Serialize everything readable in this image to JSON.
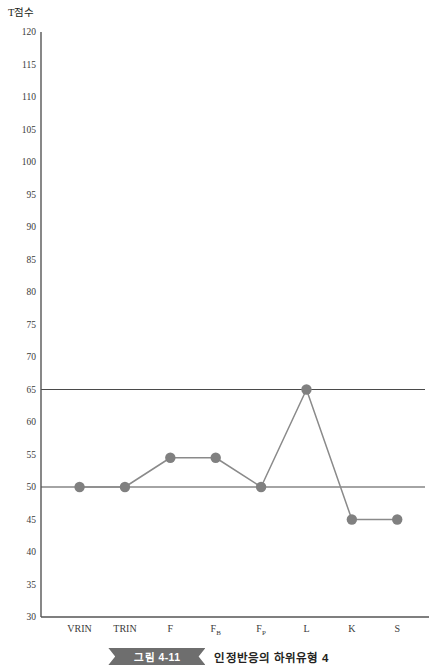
{
  "chart_data": {
    "type": "line",
    "title": "",
    "xlabel": "",
    "ylabel": "T점수",
    "ylim": [
      30,
      120
    ],
    "ytick_step": 5,
    "yticks": [
      30,
      35,
      40,
      45,
      50,
      55,
      60,
      65,
      70,
      75,
      80,
      85,
      90,
      95,
      100,
      105,
      110,
      115,
      120
    ],
    "grid": false,
    "legend": "none",
    "categories": [
      "VRIN",
      "TRIN",
      "F",
      "FB",
      "FP",
      "L",
      "K",
      "S"
    ],
    "category_labels": [
      {
        "base": "VRIN",
        "sub": ""
      },
      {
        "base": "TRIN",
        "sub": ""
      },
      {
        "base": "F",
        "sub": ""
      },
      {
        "base": "F",
        "sub": "B"
      },
      {
        "base": "F",
        "sub": "P"
      },
      {
        "base": "L",
        "sub": ""
      },
      {
        "base": "K",
        "sub": ""
      },
      {
        "base": "S",
        "sub": ""
      }
    ],
    "values": [
      50,
      50,
      54.5,
      54.5,
      50,
      65,
      45,
      45
    ],
    "reference_lines": [
      65,
      50
    ],
    "series": [
      {
        "name": "T점수 프로파일",
        "values": [
          50,
          50,
          54.5,
          54.5,
          50,
          65,
          45,
          45
        ],
        "marker": "circle",
        "color": "#808080"
      }
    ],
    "colors": {
      "marker": "#808080",
      "line": "#8a8a8a",
      "axis": "#555555",
      "reference_line": "#4a4a4a"
    }
  },
  "caption": {
    "ribbon_label": "그림 4-11",
    "title": "인정반응의 하위유형 4"
  }
}
